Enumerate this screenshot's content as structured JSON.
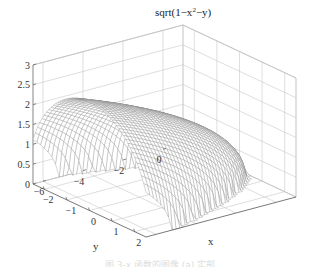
{
  "chart_data": {
    "type": "surface",
    "title_parts": {
      "prefix": "sqrt(1−x",
      "sup": "2",
      "suffix": "−y)"
    },
    "xlabel": "x",
    "ylabel": "y",
    "zlabel": "",
    "xlim": [
      -2.5,
      2.5
    ],
    "ylim": [
      -6.5,
      1
    ],
    "zlim": [
      0,
      3
    ],
    "x_ticks": [
      -2,
      -1,
      0,
      1,
      2
    ],
    "x_tick_labels": [
      "−2",
      "−1",
      "0",
      "1",
      "2"
    ],
    "y_ticks": [
      0,
      -2,
      -4,
      -6
    ],
    "y_tick_labels": [
      "0",
      "−2",
      "−4",
      "−6"
    ],
    "z_ticks": [
      0,
      0.5,
      1,
      1.5,
      2,
      2.5,
      3
    ],
    "z_tick_labels": [
      "0",
      "0.5",
      "1",
      "1.5",
      "2",
      "2.5",
      "3"
    ],
    "function": "z = real(sqrt(1 - x^2 - y)), mesh over x in [-2.5,2.5], y in [-6.5,1]",
    "grid": true,
    "style": "mesh, light gray wireframe"
  },
  "caption": "图 3-x  函数的图像 (a) 实部"
}
